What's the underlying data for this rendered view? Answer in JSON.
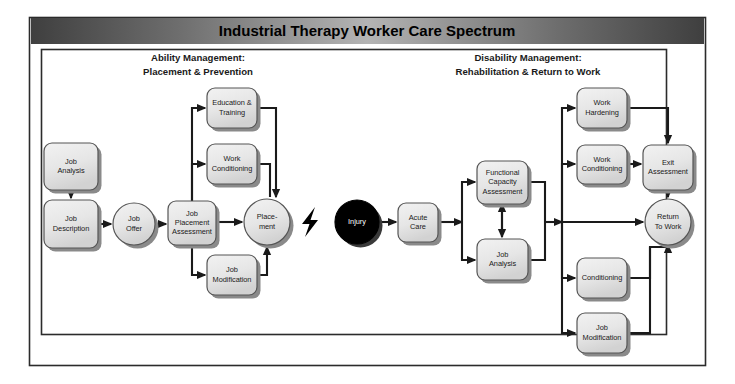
{
  "title": "Industrial Therapy Worker Care Spectrum",
  "section_headers": [
    {
      "line1": "Ability Management:",
      "line2": "Placement & Prevention"
    },
    {
      "line1": "Disability Management:",
      "line2": "Rehabilitation & Return to Work"
    }
  ],
  "colors": {
    "title_bar_dark": "#4a4a4a",
    "title_bar_light": "#b0b0b0",
    "node_fill": "#e8e8e8",
    "node_stroke": "#555555",
    "node_shadow": "#8a8a8a",
    "injury_fill": "#000000",
    "line": "#1a1a1a",
    "frame": "#2b2b2b",
    "page_background": "#ffffff"
  },
  "nodes": [
    {
      "id": "job-analysis-left",
      "name": "job-analysis",
      "shape": "box",
      "x": 44,
      "y": 143,
      "w": 54,
      "h": 47,
      "lines": [
        "Job",
        "Analysis"
      ]
    },
    {
      "id": "job-description",
      "name": "job-description",
      "shape": "box",
      "x": 44,
      "y": 200,
      "w": 54,
      "h": 48,
      "lines": [
        "Job",
        "Description"
      ]
    },
    {
      "id": "job-offer",
      "name": "job-offer",
      "shape": "circle",
      "cx": 134,
      "cy": 224,
      "r": 21,
      "lines": [
        "Job",
        "Offer"
      ]
    },
    {
      "id": "job-placement-assessment",
      "name": "job-placement-assessment",
      "shape": "box",
      "x": 168,
      "y": 201,
      "w": 48,
      "h": 44,
      "lines": [
        "Job",
        "Placement",
        "Assessment"
      ]
    },
    {
      "id": "education-training",
      "name": "education-and-training",
      "shape": "box",
      "x": 207,
      "y": 88,
      "w": 50,
      "h": 40,
      "lines": [
        "Education &",
        "Training"
      ]
    },
    {
      "id": "work-conditioning-left",
      "name": "work-conditioning-prevention",
      "shape": "box",
      "x": 207,
      "y": 144,
      "w": 50,
      "h": 40,
      "lines": [
        "Work",
        "Conditioning"
      ]
    },
    {
      "id": "job-modification-left",
      "name": "job-modification-prevention",
      "shape": "box",
      "x": 207,
      "y": 255,
      "w": 50,
      "h": 40,
      "lines": [
        "Job",
        "Modification"
      ]
    },
    {
      "id": "placement",
      "name": "placement",
      "shape": "circle",
      "cx": 267,
      "cy": 222,
      "r": 23,
      "lines": [
        "Place-",
        "ment"
      ]
    },
    {
      "id": "injury",
      "name": "injury",
      "shape": "circle",
      "cx": 357,
      "cy": 222,
      "r": 22,
      "lines": [
        "Injury"
      ],
      "inverted": true
    },
    {
      "id": "acute-care",
      "name": "acute-care",
      "shape": "box",
      "x": 398,
      "y": 203,
      "w": 40,
      "h": 39,
      "lines": [
        "Acute",
        "Care"
      ]
    },
    {
      "id": "functional-capacity-assessment",
      "name": "functional-capacity-assessment",
      "shape": "box",
      "x": 477,
      "y": 161,
      "w": 51,
      "h": 43,
      "lines": [
        "Functional",
        "Capacity",
        "Assessment"
      ]
    },
    {
      "id": "job-analysis-right",
      "name": "job-analysis-rehab",
      "shape": "box",
      "x": 477,
      "y": 239,
      "w": 51,
      "h": 41,
      "lines": [
        "Job",
        "Analysis"
      ]
    },
    {
      "id": "work-hardening",
      "name": "work-hardening",
      "shape": "box",
      "x": 577,
      "y": 88,
      "w": 50,
      "h": 40,
      "lines": [
        "Work",
        "Hardening"
      ]
    },
    {
      "id": "work-conditioning-right",
      "name": "work-conditioning-rehab",
      "shape": "box",
      "x": 577,
      "y": 145,
      "w": 50,
      "h": 39,
      "lines": [
        "Work",
        "Conditioning"
      ]
    },
    {
      "id": "exit-assessment",
      "name": "exit-assessment",
      "shape": "box",
      "x": 643,
      "y": 145,
      "w": 50,
      "h": 45,
      "lines": [
        "Exit",
        "Assessment"
      ]
    },
    {
      "id": "conditioning",
      "name": "conditioning",
      "shape": "box",
      "x": 577,
      "y": 258,
      "w": 50,
      "h": 40,
      "lines": [
        "Conditioning"
      ]
    },
    {
      "id": "job-modification-right",
      "name": "job-modification-rehab",
      "shape": "box",
      "x": 577,
      "y": 313,
      "w": 50,
      "h": 40,
      "lines": [
        "Job",
        "Modification"
      ]
    },
    {
      "id": "return-to-work",
      "name": "return-to-work",
      "shape": "circle",
      "cx": 668,
      "cy": 222,
      "r": 23,
      "lines": [
        "Return",
        "To Work"
      ]
    }
  ],
  "edges": [
    {
      "name": "edge-job-analysis-to-job-description",
      "points": "71,190 71,198",
      "arrow": "end"
    },
    {
      "name": "edge-job-description-to-job-offer",
      "points": "98,224 111,224",
      "arrow": "end"
    },
    {
      "name": "edge-job-offer-to-placement-assessment",
      "points": "155,224 166,224",
      "arrow": "end"
    },
    {
      "name": "edge-assessment-to-education",
      "points": "192,201 192,108 205,108",
      "arrow": "end"
    },
    {
      "name": "edge-assessment-to-work-conditioning",
      "points": "192,201 192,164 205,164",
      "arrow": "end"
    },
    {
      "name": "edge-assessment-to-placement",
      "points": "216,222 242,222",
      "arrow": "end"
    },
    {
      "name": "edge-assessment-to-job-modification",
      "points": "192,245 192,275 205,275",
      "arrow": "end"
    },
    {
      "name": "edge-education-to-placement",
      "points": "257,108 276,108 276,197",
      "arrow": "end"
    },
    {
      "name": "edge-work-conditioning-to-placement",
      "points": "257,164 270,164 270,197",
      "arrow": "none"
    },
    {
      "name": "edge-job-modification-to-placement",
      "points": "257,275 267,275 267,247",
      "arrow": "end"
    },
    {
      "name": "edge-injury-to-acute-care",
      "points": "379,222 396,222",
      "arrow": "end"
    },
    {
      "name": "edge-acute-care-to-branch",
      "points": "438,222 462,222",
      "arrow": "end"
    },
    {
      "name": "edge-branch-to-fca",
      "points": "462,222 462,182 475,182",
      "arrow": "end"
    },
    {
      "name": "edge-branch-to-job-analysis",
      "points": "462,222 462,260 475,260",
      "arrow": "end"
    },
    {
      "name": "edge-fca-jobanalysis-down",
      "points": "502,204 502,237",
      "arrow": "end"
    },
    {
      "name": "edge-fca-jobanalysis-up",
      "points": "502,237 502,204",
      "arrow": "end"
    },
    {
      "name": "edge-fca-to-trunk",
      "points": "528,182 545,182 545,222",
      "arrow": "none"
    },
    {
      "name": "edge-jobanalysis-to-trunk",
      "points": "528,260 545,260 545,222",
      "arrow": "none"
    },
    {
      "name": "edge-trunk-main",
      "points": "545,222 562,222",
      "arrow": "end"
    },
    {
      "name": "edge-trunk-to-work-hardening",
      "points": "562,222 562,108 575,108",
      "arrow": "end"
    },
    {
      "name": "edge-trunk-to-work-conditioning",
      "points": "562,222 562,164 575,164",
      "arrow": "end"
    },
    {
      "name": "edge-trunk-to-return-to-work",
      "points": "562,222 643,222",
      "arrow": "end"
    },
    {
      "name": "edge-trunk-to-conditioning",
      "points": "562,222 562,278 575,278",
      "arrow": "end"
    },
    {
      "name": "edge-trunk-to-job-modification",
      "points": "562,222 562,333 575,333",
      "arrow": "end"
    },
    {
      "name": "edge-work-hardening-to-exit",
      "points": "627,108 668,108 668,143",
      "arrow": "end"
    },
    {
      "name": "edge-work-conditioning-to-exit",
      "points": "627,164 641,164",
      "arrow": "end"
    },
    {
      "name": "edge-exit-to-return-to-work",
      "points": "668,190 668,197",
      "arrow": "end"
    },
    {
      "name": "edge-conditioning-to-return-to-work",
      "points": "627,278 650,278 650,247 668,247",
      "arrow": "none"
    },
    {
      "name": "edge-job-modification-to-return",
      "points": "627,333 650,333 650,247",
      "arrow": "none"
    },
    {
      "name": "edge-return-up",
      "points": "668,250 668,245",
      "arrow": "end"
    }
  ],
  "bolt": {
    "name": "lightning-bolt-icon",
    "cx": 310,
    "cy": 222
  }
}
